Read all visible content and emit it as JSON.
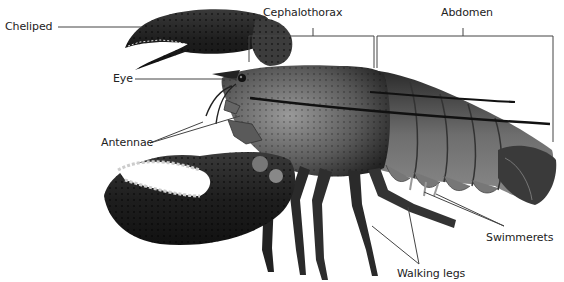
{
  "diagram": {
    "labels": [
      {
        "id": "cheliped",
        "text": "Cheliped",
        "x": 5,
        "y": 21
      },
      {
        "id": "cephalothorax",
        "text": "Cephalothorax",
        "x": 263,
        "y": 7
      },
      {
        "id": "abdomen",
        "text": "Abdomen",
        "x": 441,
        "y": 7
      },
      {
        "id": "eye",
        "text": "Eye",
        "x": 113,
        "y": 73
      },
      {
        "id": "antennae",
        "text": "Antennae",
        "x": 101,
        "y": 137
      },
      {
        "id": "swimmerets",
        "text": "Swimmerets",
        "x": 486,
        "y": 232
      },
      {
        "id": "walking-legs",
        "text": "Walking legs",
        "x": 397,
        "y": 268
      }
    ]
  }
}
